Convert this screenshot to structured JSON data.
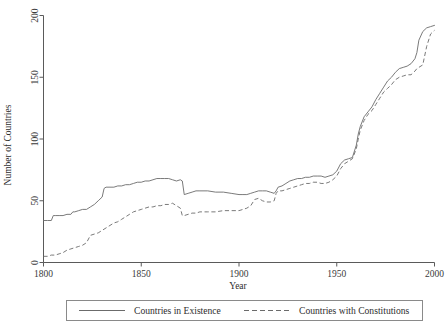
{
  "chart_data": {
    "type": "line",
    "title": "",
    "xlabel": "Year",
    "ylabel": "Number of Countries",
    "xlim": [
      1800,
      2000
    ],
    "ylim": [
      0,
      200
    ],
    "xticks": [
      1800,
      1850,
      1900,
      1950,
      2000
    ],
    "xtick_labels": [
      "1800",
      "1850",
      "1900",
      "1950",
      "2000"
    ],
    "yticks": [
      0,
      50,
      100,
      150,
      200
    ],
    "ytick_labels": [
      "0",
      "50",
      "100",
      "150",
      "200"
    ],
    "grid": false,
    "legend_position": "below",
    "series": [
      {
        "name": "Countries in Existence",
        "style": "solid",
        "color": "#6b6b6b",
        "x": [
          1800,
          1802,
          1804,
          1805,
          1806,
          1808,
          1810,
          1812,
          1814,
          1815,
          1816,
          1818,
          1820,
          1822,
          1824,
          1826,
          1828,
          1830,
          1831,
          1832,
          1834,
          1836,
          1838,
          1840,
          1842,
          1844,
          1846,
          1848,
          1850,
          1852,
          1854,
          1856,
          1858,
          1860,
          1862,
          1864,
          1866,
          1868,
          1870,
          1871,
          1872,
          1874,
          1876,
          1878,
          1880,
          1884,
          1888,
          1892,
          1896,
          1900,
          1902,
          1904,
          1906,
          1908,
          1910,
          1912,
          1914,
          1916,
          1918,
          1919,
          1920,
          1922,
          1924,
          1926,
          1928,
          1930,
          1932,
          1934,
          1936,
          1938,
          1940,
          1942,
          1944,
          1946,
          1948,
          1950,
          1952,
          1954,
          1956,
          1958,
          1960,
          1961,
          1962,
          1964,
          1966,
          1968,
          1970,
          1972,
          1974,
          1976,
          1978,
          1980,
          1982,
          1984,
          1986,
          1988,
          1990,
          1991,
          1992,
          1994,
          1996,
          1998,
          2000
        ],
        "y": [
          34,
          34,
          34,
          38,
          38,
          38,
          38,
          39,
          39,
          41,
          41,
          42,
          43,
          43,
          45,
          47,
          50,
          53,
          60,
          61,
          61,
          61,
          62,
          62,
          63,
          63,
          64,
          65,
          65,
          66,
          66,
          67,
          68,
          68,
          68,
          68,
          67,
          66,
          67,
          66,
          55,
          56,
          57,
          58,
          58,
          58,
          57,
          57,
          56,
          55,
          55,
          55,
          56,
          57,
          58,
          58,
          58,
          57,
          56,
          58,
          61,
          62,
          64,
          66,
          67,
          68,
          68,
          69,
          69,
          70,
          70,
          70,
          69,
          70,
          71,
          74,
          80,
          83,
          84,
          85,
          95,
          104,
          110,
          118,
          122,
          126,
          132,
          137,
          142,
          147,
          150,
          154,
          157,
          158,
          159,
          161,
          165,
          170,
          180,
          187,
          190,
          191,
          192
        ]
      },
      {
        "name": "Countries with Constitutions",
        "style": "dashed",
        "color": "#6b6b6b",
        "x": [
          1800,
          1802,
          1804,
          1806,
          1808,
          1810,
          1812,
          1814,
          1816,
          1818,
          1820,
          1822,
          1824,
          1826,
          1828,
          1830,
          1832,
          1834,
          1836,
          1838,
          1840,
          1842,
          1844,
          1846,
          1848,
          1850,
          1852,
          1854,
          1856,
          1858,
          1860,
          1862,
          1864,
          1866,
          1868,
          1870,
          1871,
          1872,
          1874,
          1876,
          1878,
          1880,
          1884,
          1888,
          1892,
          1896,
          1900,
          1902,
          1904,
          1906,
          1908,
          1910,
          1912,
          1914,
          1916,
          1918,
          1919,
          1920,
          1922,
          1924,
          1926,
          1928,
          1930,
          1932,
          1934,
          1936,
          1938,
          1940,
          1942,
          1944,
          1946,
          1948,
          1950,
          1952,
          1954,
          1956,
          1958,
          1960,
          1961,
          1962,
          1964,
          1966,
          1968,
          1970,
          1972,
          1974,
          1976,
          1978,
          1980,
          1982,
          1984,
          1986,
          1988,
          1990,
          1991,
          1992,
          1994,
          1996,
          1998,
          2000
        ],
        "y": [
          5,
          5,
          6,
          6,
          7,
          8,
          10,
          11,
          12,
          13,
          14,
          16,
          22,
          23,
          24,
          26,
          28,
          30,
          32,
          33,
          35,
          37,
          39,
          41,
          42,
          43,
          44,
          45,
          45,
          46,
          46,
          47,
          47,
          48,
          46,
          44,
          38,
          38,
          39,
          40,
          40,
          41,
          41,
          41,
          42,
          42,
          42,
          43,
          44,
          46,
          51,
          52,
          50,
          49,
          49,
          50,
          56,
          58,
          58,
          59,
          60,
          61,
          62,
          63,
          64,
          64,
          65,
          65,
          64,
          64,
          65,
          67,
          70,
          76,
          80,
          82,
          84,
          92,
          100,
          107,
          115,
          120,
          123,
          128,
          133,
          138,
          141,
          144,
          148,
          150,
          151,
          152,
          152,
          155,
          157,
          158,
          160,
          175,
          185,
          188
        ]
      }
    ]
  },
  "legend": {
    "entries": [
      {
        "label": "Countries in Existence",
        "style": "solid"
      },
      {
        "label": "Countries with Constitutions",
        "style": "dashed"
      }
    ]
  }
}
